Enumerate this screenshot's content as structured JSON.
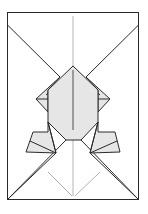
{
  "diagram": {
    "type": "origami-fold-diagram",
    "colors": {
      "paper_front": "#ffffff",
      "paper_back": "#e6e6e6",
      "line": "#2a2a2a",
      "crease": "#b4b4b4"
    }
  }
}
